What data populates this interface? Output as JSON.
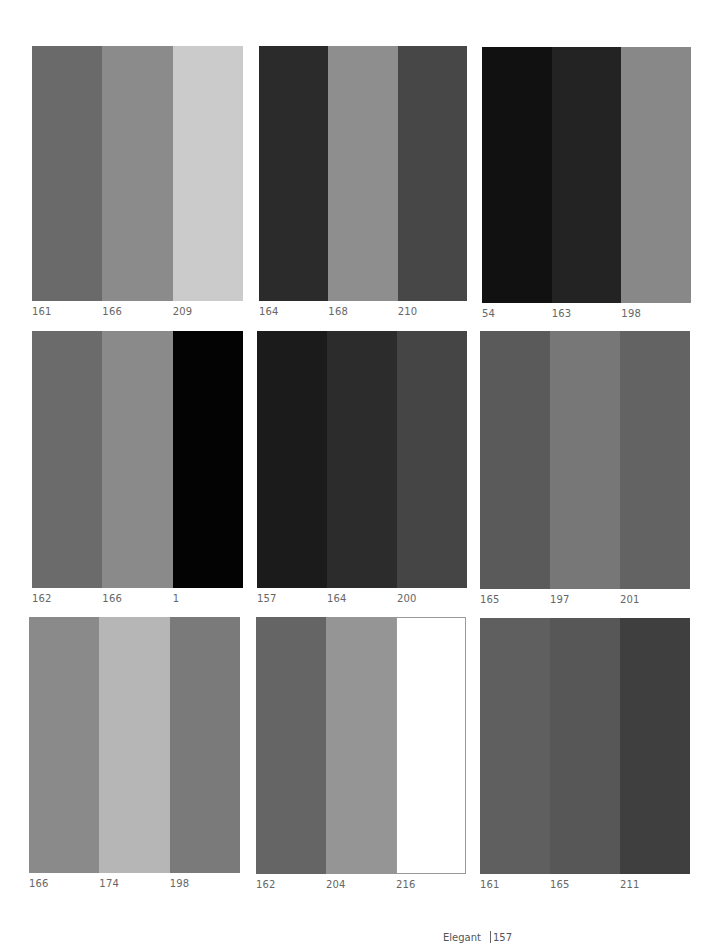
{
  "page": {
    "footer": {
      "section": "Elegant",
      "page_number": "157"
    }
  },
  "swatches": [
    {
      "id": "p1",
      "box": [
        32,
        46,
        211,
        255
      ],
      "stripes": [
        {
          "label": "161",
          "color": "#6a6a6a"
        },
        {
          "label": "166",
          "color": "#8b8b8b"
        },
        {
          "label": "209",
          "color": "#cbcbcb"
        }
      ]
    },
    {
      "id": "p2",
      "box": [
        259,
        46,
        208,
        255
      ],
      "stripes": [
        {
          "label": "164",
          "color": "#2b2b2b"
        },
        {
          "label": "168",
          "color": "#8e8e8e"
        },
        {
          "label": "210",
          "color": "#474747"
        }
      ]
    },
    {
      "id": "p3",
      "box": [
        482,
        47,
        209,
        256
      ],
      "stripes": [
        {
          "label": "54",
          "color": "#111111"
        },
        {
          "label": "163",
          "color": "#232323"
        },
        {
          "label": "198",
          "color": "#888888"
        }
      ]
    },
    {
      "id": "p4",
      "box": [
        32,
        331,
        211,
        257
      ],
      "stripes": [
        {
          "label": "162",
          "color": "#6b6b6b"
        },
        {
          "label": "166",
          "color": "#8a8a8a"
        },
        {
          "label": "1",
          "color": "#030303"
        }
      ]
    },
    {
      "id": "p5",
      "box": [
        257,
        331,
        210,
        257
      ],
      "stripes": [
        {
          "label": "157",
          "color": "#1b1b1b"
        },
        {
          "label": "164",
          "color": "#2c2c2c"
        },
        {
          "label": "200",
          "color": "#454545"
        }
      ]
    },
    {
      "id": "p6",
      "box": [
        480,
        331,
        210,
        258
      ],
      "stripes": [
        {
          "label": "165",
          "color": "#5a5a5a"
        },
        {
          "label": "197",
          "color": "#777777"
        },
        {
          "label": "201",
          "color": "#636363"
        }
      ]
    },
    {
      "id": "p7",
      "box": [
        29,
        617,
        211,
        256
      ],
      "stripes": [
        {
          "label": "166",
          "color": "#8a8a8a"
        },
        {
          "label": "174",
          "color": "#b6b6b6"
        },
        {
          "label": "198",
          "color": "#7a7a7a"
        }
      ]
    },
    {
      "id": "p8",
      "box": [
        256,
        617,
        210,
        257
      ],
      "stripes": [
        {
          "label": "162",
          "color": "#656565"
        },
        {
          "label": "204",
          "color": "#959595"
        },
        {
          "label": "216",
          "color": "#ffffff",
          "bordered": true
        }
      ]
    },
    {
      "id": "p9",
      "box": [
        480,
        618,
        210,
        256
      ],
      "stripes": [
        {
          "label": "161",
          "color": "#5f5f5f"
        },
        {
          "label": "165",
          "color": "#575757"
        },
        {
          "label": "211",
          "color": "#3f3f3f"
        }
      ]
    }
  ]
}
